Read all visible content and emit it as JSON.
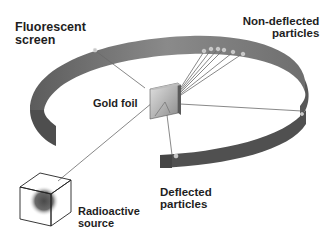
{
  "diagram": {
    "title_partial": "",
    "labels": {
      "fluorescent_screen": [
        "Fluorescent",
        "screen"
      ],
      "non_deflected": [
        "Non-deflected",
        "particles"
      ],
      "gold_foil": "Gold foil",
      "deflected": [
        "Deflected",
        "particles"
      ],
      "radioactive_source": [
        "Radioactive",
        "source"
      ]
    },
    "colors": {
      "band_outer": "#7a7a7a",
      "band_inner": "#5a5a5a",
      "band_dark": "#4a4a4a",
      "foil_light": "#d8d8d8",
      "foil_dark": "#8a8a8a",
      "source_core": "#555555",
      "lines": "#6a6a6a"
    },
    "impact_points": {
      "non_deflected_count": 6,
      "deflected_count": 2,
      "backscattered_count": 1
    }
  }
}
